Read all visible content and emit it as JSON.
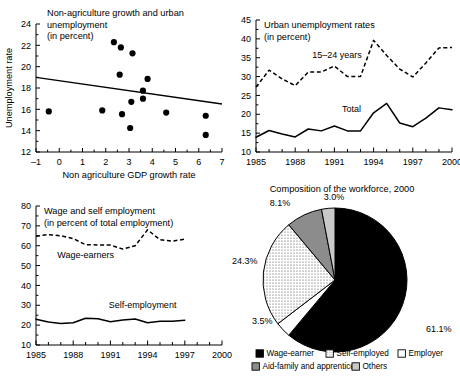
{
  "figure": {
    "panels": [
      "scatter-nonag-growth",
      "urban-unemployment-rates",
      "wage-self-employment",
      "workforce-composition"
    ]
  },
  "chart_data": [
    {
      "id": "scatter-nonag-growth",
      "type": "scatter",
      "title": "Non-agriculture growth and urban unemployment",
      "subtitle": "(in percent)",
      "title_lines": [
        "Non-agriculture growth and urban",
        "unemployment",
        "(in percent)"
      ],
      "xlabel": "Non agriculture GDP growth rate",
      "ylabel": "Unemployment rate",
      "xlim": [
        -1,
        7
      ],
      "ylim": [
        12,
        24
      ],
      "xticks": [
        -1,
        0,
        1,
        2,
        3,
        4,
        5,
        6,
        7
      ],
      "xtick_labels": [
        "–1",
        "0",
        "1",
        "2",
        "3",
        "4",
        "5",
        "6",
        "7"
      ],
      "yticks": [
        12,
        14,
        16,
        18,
        20,
        22,
        24
      ],
      "ytick_labels": [
        "12",
        "14",
        "16",
        "18",
        "20",
        "22",
        "24"
      ],
      "grid": false,
      "points": [
        {
          "x": -0.45,
          "y": 15.8
        },
        {
          "x": 1.85,
          "y": 15.9
        },
        {
          "x": 2.35,
          "y": 22.3
        },
        {
          "x": 2.6,
          "y": 19.25
        },
        {
          "x": 2.65,
          "y": 21.8
        },
        {
          "x": 2.7,
          "y": 15.55
        },
        {
          "x": 3.05,
          "y": 14.25
        },
        {
          "x": 3.1,
          "y": 16.7
        },
        {
          "x": 3.15,
          "y": 21.25
        },
        {
          "x": 3.6,
          "y": 17.75
        },
        {
          "x": 3.6,
          "y": 17.0
        },
        {
          "x": 3.8,
          "y": 18.85
        },
        {
          "x": 4.6,
          "y": 15.7
        },
        {
          "x": 6.3,
          "y": 15.4
        },
        {
          "x": 6.3,
          "y": 13.6
        }
      ],
      "trendline": {
        "x1": -1,
        "y1": 19.0,
        "x2": 7,
        "y2": 16.5
      }
    },
    {
      "id": "urban-unemployment-rates",
      "type": "line",
      "title": "Urban unemployment rates",
      "subtitle": "(in percent)",
      "title_lines": [
        "Urban unemployment rates",
        "(in percent)"
      ],
      "xlabel": "",
      "ylabel": "",
      "xlim": [
        1985,
        2000
      ],
      "ylim": [
        10,
        45
      ],
      "xticks": [
        1985,
        1986,
        1987,
        1988,
        1989,
        1990,
        1991,
        1992,
        1993,
        1994,
        1995,
        1996,
        1997,
        1998,
        1999,
        2000
      ],
      "xtick_labels": [
        "1985",
        "1988",
        "1991",
        "1994",
        "1997",
        "2000"
      ],
      "xtick_label_values": [
        1985,
        1988,
        1991,
        1994,
        1997,
        2000
      ],
      "yticks": [
        10,
        15,
        20,
        25,
        30,
        35,
        40,
        45
      ],
      "ytick_labels": [
        "10",
        "15",
        "20",
        "25",
        "30",
        "35",
        "40",
        "45"
      ],
      "grid": false,
      "x": [
        1985,
        1986,
        1987,
        1988,
        1989,
        1990,
        1991,
        1992,
        1993,
        1994,
        1995,
        1996,
        1997,
        1998,
        1999,
        2000
      ],
      "series": [
        {
          "name": "15–24 years",
          "style": "dashed",
          "label_at": {
            "x": 1991.2,
            "y": 35.0
          },
          "values": [
            27.2,
            31.7,
            29.4,
            27.6,
            31.2,
            31.2,
            32.8,
            30.0,
            30.0,
            39.6,
            35.6,
            32.0,
            29.9,
            33.6,
            37.6,
            37.7
          ]
        },
        {
          "name": "Total",
          "style": "solid",
          "label_at": {
            "x": 1992.3,
            "y": 20.6
          },
          "values": [
            13.9,
            15.7,
            14.8,
            14.0,
            16.1,
            15.6,
            16.9,
            15.6,
            15.6,
            20.4,
            22.9,
            17.7,
            16.7,
            19.0,
            21.7,
            21.2
          ]
        }
      ]
    },
    {
      "id": "wage-self-employment",
      "type": "line",
      "title": "Wage and self employment",
      "subtitle": "(in percent of total employment)",
      "title_lines": [
        "Wage and self employment",
        "(in percent of total employment)"
      ],
      "xlabel": "",
      "ylabel": "",
      "xlim": [
        1985,
        2000
      ],
      "ylim": [
        10,
        80
      ],
      "xticks": [
        1985,
        1986,
        1987,
        1988,
        1989,
        1990,
        1991,
        1992,
        1993,
        1994,
        1995,
        1996,
        1997,
        1998,
        1999,
        2000
      ],
      "xtick_labels": [
        "1985",
        "1988",
        "1991",
        "1994",
        "1997",
        "2000"
      ],
      "xtick_label_values": [
        1985,
        1988,
        1991,
        1994,
        1997,
        2000
      ],
      "yticks": [
        10,
        20,
        30,
        40,
        50,
        60,
        70,
        80
      ],
      "ytick_labels": [
        "10",
        "20",
        "30",
        "40",
        "50",
        "60",
        "70",
        "80"
      ],
      "grid": false,
      "gap_after": 1997,
      "x": [
        1985,
        1986,
        1987,
        1988,
        1989,
        1990,
        1991,
        1992,
        1993,
        1994,
        1995,
        1996,
        1997,
        1999,
        2000
      ],
      "series": [
        {
          "name": "Wage-earners",
          "style": "dashed",
          "label_at": {
            "x": 1989.0,
            "y": 54.0
          },
          "values": [
            64.8,
            65.6,
            65.0,
            63.6,
            60.5,
            60.4,
            60.3,
            58.3,
            60.0,
            68.0,
            63.0,
            62.3,
            63.3,
            63.0,
            60.2
          ]
        },
        {
          "name": "Self-employment",
          "style": "solid",
          "label_at": {
            "x": 1993.6,
            "y": 28.5
          },
          "values": [
            23.0,
            21.6,
            20.8,
            21.2,
            23.5,
            23.2,
            21.7,
            22.6,
            23.1,
            21.2,
            21.9,
            22.0,
            22.5,
            23.6,
            22.7
          ]
        }
      ]
    },
    {
      "id": "workforce-composition",
      "type": "pie",
      "title": "Composition of the workforce, 2000",
      "slices": [
        {
          "label": "Wage-earner",
          "value": 61.1,
          "value_label": "61.1%",
          "fill": "solid-black"
        },
        {
          "label": "Employer",
          "value": 3.5,
          "value_label": "3.5%",
          "fill": "white"
        },
        {
          "label": "Self-employed",
          "value": 24.3,
          "value_label": "24.3%",
          "fill": "dotted"
        },
        {
          "label": "Aid-family and apprentice",
          "value": 8.1,
          "value_label": "8.1%",
          "fill": "dark-gray"
        },
        {
          "label": "Others",
          "value": 3.0,
          "value_label": "3.0%",
          "fill": "light-gray"
        }
      ],
      "legend": {
        "position": "bottom",
        "rows": [
          [
            {
              "label": "Wage-earner",
              "fill": "solid-black"
            },
            {
              "label": "Self-employed",
              "fill": "dotted"
            },
            {
              "label": "Employer",
              "fill": "white"
            }
          ],
          [
            {
              "label": "Aid-family and apprentice",
              "fill": "dark-gray"
            },
            {
              "label": "Others",
              "fill": "light-gray"
            }
          ]
        ]
      },
      "colors": {
        "solid-black": "#000000",
        "white": "#ffffff",
        "dotted": "#e8e8e8",
        "dark-gray": "#8c8c8c",
        "light-gray": "#c9c9c9"
      }
    }
  ]
}
